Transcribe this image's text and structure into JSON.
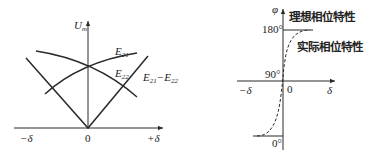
{
  "left_diagram": {
    "y_axis_label": "U",
    "y_axis_label_sub": "m",
    "x_axis_left_label": "−δ",
    "x_axis_right_label": "+δ",
    "origin_label": "0",
    "curves": [
      {
        "name": "E21",
        "label_main": "E",
        "label_sub": "21",
        "shape": "rising-concave"
      },
      {
        "name": "E22",
        "label_main": "E",
        "label_sub": "22",
        "shape": "falling-concave"
      },
      {
        "name": "E21-E22",
        "label_main": "E",
        "label_sub": "21",
        "label_mid": "−E",
        "label_sub2": "22",
        "shape": "V-absolute-difference"
      }
    ]
  },
  "right_diagram": {
    "y_axis_label": "φ",
    "x_axis_left_label": "−δ",
    "x_axis_right_label": "δ",
    "origin_label": "0",
    "tick_labels": {
      "top": "180°",
      "middle": "90°",
      "bottom": "0°"
    },
    "legend": {
      "ideal": "理想相位特性",
      "actual": "实际相位特性"
    }
  },
  "colors": {
    "line": "#2a2a2a",
    "background": "#ffffff"
  }
}
